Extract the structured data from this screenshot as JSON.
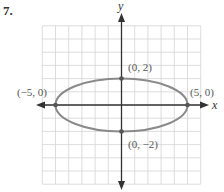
{
  "problem": {
    "number": "7."
  },
  "chart_data": {
    "type": "line",
    "title": "",
    "xlabel": "x",
    "ylabel": "y",
    "xlim": [
      -6,
      6
    ],
    "ylim": [
      -6,
      6
    ],
    "grid": true,
    "curve": "ellipse",
    "equation_implied": "x^2/25 + y^2/4 = 1",
    "center": [
      0,
      0
    ],
    "semi_major_axis": 5,
    "semi_minor_axis": 2,
    "points": [
      {
        "label": "(0, 2)",
        "x": 0,
        "y": 2
      },
      {
        "label": "(−5, 0)",
        "x": -5,
        "y": 0
      },
      {
        "label": "(5, 0)",
        "x": 5,
        "y": 0
      },
      {
        "label": "(0, −2)",
        "x": 0,
        "y": -2
      }
    ],
    "colors": {
      "curve": "#8a8a8a",
      "axes": "#333333",
      "grid": "#d4d4d4",
      "points": "#555555"
    }
  }
}
